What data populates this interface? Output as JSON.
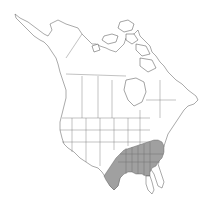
{
  "map": {
    "region": "North America",
    "type": "species range map",
    "colors": {
      "background": "#ffffff",
      "land": "#ffffff",
      "outline": "#555555",
      "range_fill": "#a0a0a0"
    },
    "shaded_range": {
      "description": "Southeastern United States",
      "states": [
        "Texas (east)",
        "Oklahoma (southeast)",
        "Arkansas",
        "Louisiana",
        "Mississippi",
        "Alabama",
        "Georgia",
        "Florida (panhandle/north)",
        "Tennessee",
        "Kentucky",
        "South Carolina",
        "North Carolina",
        "Virginia",
        "Missouri (south)"
      ]
    }
  }
}
